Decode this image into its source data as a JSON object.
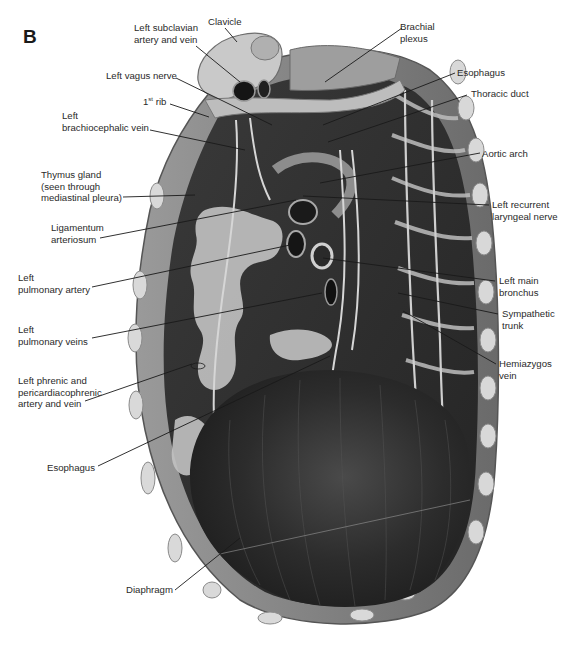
{
  "figure": {
    "panel_letter": "B",
    "colors": {
      "background": "#ffffff",
      "label_text": "#2a2a2a",
      "leader_line": "#1a1a1a",
      "muscle_dark": "#2b2b2b",
      "diaphragm": "#262626",
      "bone_light": "#cfcfcf",
      "thymus_fat": "#bdbdbd"
    }
  },
  "labels": {
    "left_subclavian": "Left subclavian\nartery and vein",
    "clavicle": "Clavicle",
    "brachial_plexus": "Brachial\nplexus",
    "left_vagus_nerve": "Left vagus nerve",
    "esophagus_top": "Esophagus",
    "first_rib_num": "1",
    "first_rib_sup": "st",
    "first_rib_word": " rib",
    "thoracic_duct": "Thoracic duct",
    "left_brachiocephalic_vein": "Left\nbrachiocephalic vein",
    "aortic_arch": "Aortic arch",
    "thymus_gland": "Thymus gland\n(seen through\nmediastinal pleura)",
    "left_recurrent_laryngeal": "Left recurrent\nlaryngeal nerve",
    "ligamentum_arteriosum": "Ligamentum\narteriosum",
    "left_pulmonary_artery": "Left\npulmonary artery",
    "left_main_bronchus": "Left main\nbronchus",
    "sympathetic_trunk": "Sympathetic\ntrunk",
    "left_pulmonary_veins": "Left\npulmonary veins",
    "hemiazygos_vein": "Hemiazygos\nvein",
    "left_phrenic": "Left phrenic and\npericardiacophrenic\nartery and vein",
    "esophagus_bottom": "Esophagus",
    "diaphragm": "Diaphragm"
  },
  "leaders": [
    {
      "label": "Left subclavian artery and vein",
      "from": [
        196,
        46
      ],
      "to": [
        240,
        82
      ]
    },
    {
      "label": "Clavicle",
      "from": [
        225,
        27
      ],
      "to": [
        237,
        42
      ]
    },
    {
      "label": "Brachial plexus",
      "from": [
        402,
        28
      ],
      "to": [
        325,
        82
      ]
    },
    {
      "label": "Left vagus nerve",
      "from": [
        175,
        78
      ],
      "to": [
        272,
        125
      ]
    },
    {
      "label": "Esophagus",
      "from": [
        455,
        73
      ],
      "to": [
        323,
        125
      ]
    },
    {
      "label": "1st rib",
      "from": [
        170,
        104
      ],
      "to": [
        209,
        117
      ]
    },
    {
      "label": "Thoracic duct",
      "from": [
        467,
        95
      ],
      "to": [
        328,
        142
      ]
    },
    {
      "label": "Left brachiocephalic vein",
      "from": [
        150,
        130
      ],
      "to": [
        245,
        150
      ]
    },
    {
      "label": "Aortic arch",
      "from": [
        480,
        153
      ],
      "to": [
        320,
        183
      ]
    },
    {
      "label": "Thymus gland",
      "from": [
        123,
        197
      ],
      "to": [
        195,
        195
      ]
    },
    {
      "label": "Left recurrent laryngeal nerve",
      "from": [
        489,
        205
      ],
      "to": [
        303,
        196
      ]
    },
    {
      "label": "Ligamentum arteriosum",
      "from": [
        100,
        238
      ],
      "to": [
        296,
        200
      ]
    },
    {
      "label": "Left pulmonary artery",
      "from": [
        92,
        287
      ],
      "to": [
        290,
        245
      ]
    },
    {
      "label": "Left main bronchus",
      "from": [
        495,
        281
      ],
      "to": [
        323,
        258
      ]
    },
    {
      "label": "Sympathetic trunk",
      "from": [
        498,
        314
      ],
      "to": [
        398,
        293
      ]
    },
    {
      "label": "Left pulmonary veins",
      "from": [
        92,
        338
      ],
      "to": [
        322,
        293
      ]
    },
    {
      "label": "Hemiazygos vein",
      "from": [
        496,
        364
      ],
      "to": [
        403,
        311
      ]
    },
    {
      "label": "Left phrenic and pericardiacophrenic artery and vein",
      "from": [
        85,
        401
      ],
      "to": [
        192,
        364
      ]
    },
    {
      "label": "Esophagus (lower)",
      "from": [
        98,
        466
      ],
      "to": [
        330,
        356
      ]
    },
    {
      "label": "Diaphragm",
      "from": [
        175,
        590
      ],
      "to": [
        240,
        538
      ]
    }
  ]
}
